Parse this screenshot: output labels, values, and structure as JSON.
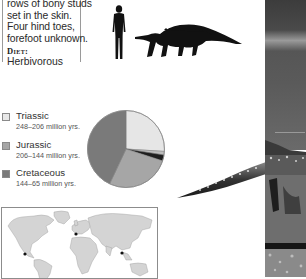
{
  "info": {
    "lines": [
      "rows of bony studs",
      "set in the skin.",
      "Four hind toes,",
      "forefoot unknown."
    ],
    "diet_label": "Diet:",
    "diet_value": "Herbivorous"
  },
  "scale_figure": {
    "human_icon": "human-silhouette-icon",
    "animal_icon": "dinosaur-silhouette-icon"
  },
  "legend": [
    {
      "name": "Triassic",
      "range": "248–206 million yrs.",
      "color": "#e8e8e8"
    },
    {
      "name": "Jurassic",
      "range": "206–144 million yrs.",
      "color": "#a6a6a6"
    },
    {
      "name": "Cretaceous",
      "range": "144–65 million yrs.",
      "color": "#7a7a7a"
    }
  ],
  "chart_data": {
    "type": "pie",
    "title": "",
    "categories": [
      "Triassic",
      "Late Triassic span (highlight)",
      "Dinosaur lifespan (highlight)",
      "Jurassic",
      "Cretaceous"
    ],
    "values": [
      26,
      1.5,
      2.5,
      27,
      43
    ],
    "colors": [
      "#e6e6e6",
      "#bdbdbd",
      "#1e1e1e",
      "#a6a6a6",
      "#7a7a7a"
    ],
    "start_angle_deg": 0,
    "direction": "clockwise",
    "legend_position": "left"
  },
  "map": {
    "icon": "world-map-icon",
    "markers": [
      {
        "region": "Western North America"
      },
      {
        "region": "Britain"
      },
      {
        "region": "China"
      }
    ]
  },
  "photo": {
    "icon": "dinosaur-photo"
  }
}
